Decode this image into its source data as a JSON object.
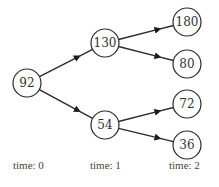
{
  "diagram": {
    "type": "binomial-tree",
    "nodes": [
      {
        "id": "n0",
        "value": "92",
        "x": 27,
        "y": 83
      },
      {
        "id": "n1u",
        "value": "130",
        "x": 105,
        "y": 43
      },
      {
        "id": "n1d",
        "value": "54",
        "x": 105,
        "y": 125
      },
      {
        "id": "n2uu",
        "value": "180",
        "x": 187,
        "y": 22
      },
      {
        "id": "n2ud",
        "value": "80",
        "x": 187,
        "y": 64
      },
      {
        "id": "n2du",
        "value": "72",
        "x": 187,
        "y": 104
      },
      {
        "id": "n2dd",
        "value": "36",
        "x": 187,
        "y": 145
      }
    ],
    "edges": [
      {
        "from": "n0",
        "to": "n1u"
      },
      {
        "from": "n0",
        "to": "n1d"
      },
      {
        "from": "n1u",
        "to": "n2uu"
      },
      {
        "from": "n1u",
        "to": "n2ud"
      },
      {
        "from": "n1d",
        "to": "n2du"
      },
      {
        "from": "n1d",
        "to": "n2dd"
      }
    ],
    "time_labels": [
      "time: 0",
      "time: 1",
      "time: 2"
    ]
  }
}
